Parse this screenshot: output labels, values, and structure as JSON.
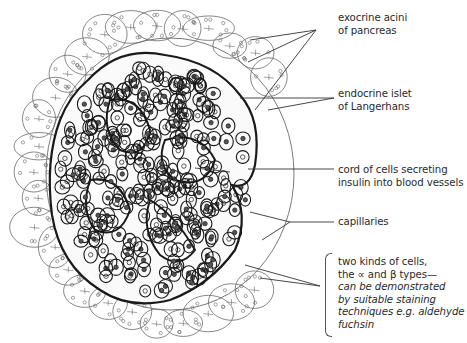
{
  "diagram": {
    "labels": [
      {
        "id": "exocrine",
        "lines": [
          "exocrine acini",
          "of pancreas"
        ],
        "x": 338,
        "y": 12
      },
      {
        "id": "endocrine",
        "lines": [
          "endocrine islet",
          "of Langerhans"
        ],
        "x": 338,
        "y": 88
      },
      {
        "id": "cord",
        "lines": [
          "cord of cells secreting",
          "insulin into blood vessels"
        ],
        "x": 338,
        "y": 164
      },
      {
        "id": "capillaries",
        "lines": [
          "capillaries"
        ],
        "x": 338,
        "y": 216
      },
      {
        "id": "cell-types",
        "lines": [
          "two kinds of cells,",
          "the ∝ and β types—"
        ],
        "italic_lines": [
          "can be demonstrated",
          "by suitable staining",
          "techniques e.g. aldehyde",
          "fuchsin"
        ],
        "x": 338,
        "y": 256
      }
    ],
    "leader_lines": {
      "exocrine": [
        [
          316,
          30,
          250,
          40
        ],
        [
          316,
          30,
          248,
          62
        ],
        [
          316,
          30,
          255,
          110
        ]
      ],
      "endocrine": [
        [
          334,
          98,
          240,
          98
        ],
        [
          334,
          98,
          268,
          110
        ]
      ],
      "cord": [
        [
          334,
          169,
          248,
          169
        ],
        [
          195,
          168,
          230,
          172
        ]
      ],
      "capillaries": [
        [
          334,
          222,
          290,
          222
        ],
        [
          290,
          222,
          250,
          212
        ],
        [
          290,
          222,
          262,
          240
        ]
      ],
      "cell-types": [
        [
          320,
          286,
          260,
          278
        ],
        [
          320,
          286,
          245,
          265
        ]
      ]
    },
    "colors": {
      "ink": "#1a1a1a",
      "thin": "#6a6a6a",
      "text": "#2a2a2a"
    }
  }
}
